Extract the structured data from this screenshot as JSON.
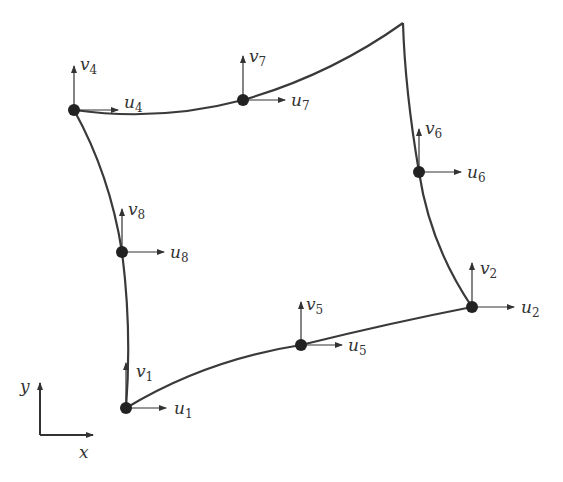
{
  "diagram": {
    "type": "eight-node serendipity quadrilateral element (distorted)",
    "colors": {
      "edge": "#333333",
      "node": "#222222",
      "arrow": "#333333",
      "background": "#ffffff"
    },
    "corner_without_node": {
      "x": 403,
      "y": 23
    },
    "nodes": [
      {
        "id": 1,
        "x": 126,
        "y": 408,
        "u": "u",
        "u_sub": "1",
        "v": "v",
        "v_sub": "1"
      },
      {
        "id": 2,
        "x": 472,
        "y": 307,
        "u": "u",
        "u_sub": "2",
        "v": "v",
        "v_sub": "2"
      },
      {
        "id": 4,
        "x": 74,
        "y": 110,
        "u": "u",
        "u_sub": "4",
        "v": "v",
        "v_sub": "4"
      },
      {
        "id": 5,
        "x": 301,
        "y": 345,
        "u": "u",
        "u_sub": "5",
        "v": "v",
        "v_sub": "5"
      },
      {
        "id": 6,
        "x": 419,
        "y": 172,
        "u": "u",
        "u_sub": "6",
        "v": "v",
        "v_sub": "6"
      },
      {
        "id": 7,
        "x": 243,
        "y": 100,
        "u": "u",
        "u_sub": "7",
        "v": "v",
        "v_sub": "7"
      },
      {
        "id": 8,
        "x": 122,
        "y": 252,
        "u": "u",
        "u_sub": "8",
        "v": "v",
        "v_sub": "8"
      }
    ],
    "axes": {
      "x_label": "x",
      "y_label": "y"
    }
  }
}
